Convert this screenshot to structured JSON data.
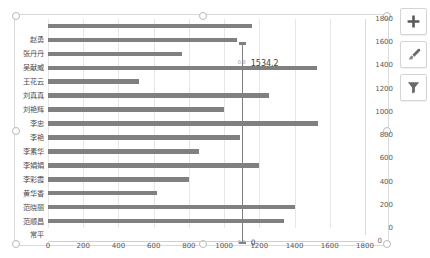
{
  "chart_data": {
    "type": "bar",
    "orientation": "horizontal",
    "title": "",
    "xlabel": "",
    "ylabel": "",
    "grid": true,
    "legend": "none",
    "xlim": [
      0,
      1800
    ],
    "x_ticks": [
      "0",
      "200",
      "400",
      "600",
      "800",
      "1000",
      "1200",
      "1400",
      "1600",
      "1800"
    ],
    "secondary_axis": {
      "position": "right",
      "lim": [
        0,
        1800
      ],
      "ticks": [
        "1800",
        "1600",
        "1400",
        "1200",
        "1000",
        "800",
        "600",
        "400",
        "200",
        "0"
      ]
    },
    "categories": [
      "赵勇",
      "张丹丹",
      "吴献威",
      "王花云",
      "刘真真",
      "刘艳辉",
      "李忠",
      "李艳",
      "李素华",
      "李娟娟",
      "李彩霞",
      "黄华香",
      "范晓丽",
      "范顺昌",
      "常平"
    ],
    "values": [
      1160,
      1075,
      760,
      1530,
      515,
      1255,
      1000,
      1535,
      1090,
      855,
      1200,
      800,
      620,
      1400,
      1340
    ],
    "reference_line": {
      "value": 1100,
      "label_top": "1534.2",
      "label_bottom": "0",
      "marker_top": "0.0",
      "marker_bottom": "0.0"
    },
    "edge_label": "0"
  },
  "chart_tools": [
    {
      "name": "chart-elements-button",
      "icon": "plus-icon",
      "label": "+"
    },
    {
      "name": "chart-styles-button",
      "icon": "paintbrush-icon",
      "label": ""
    },
    {
      "name": "chart-filters-button",
      "icon": "funnel-icon",
      "label": ""
    }
  ]
}
